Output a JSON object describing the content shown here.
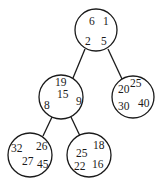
{
  "diagram": {
    "type": "tree",
    "nodes": [
      {
        "id": "root",
        "cx": 96,
        "cy": 30,
        "r": 21,
        "values": [
          {
            "text": "6",
            "x": 89,
            "y": 25
          },
          {
            "text": "1",
            "x": 103,
            "y": 25
          },
          {
            "text": "2",
            "x": 85,
            "y": 45
          },
          {
            "text": "5",
            "x": 101,
            "y": 45
          }
        ]
      },
      {
        "id": "left",
        "cx": 61,
        "cy": 97,
        "r": 22,
        "values": [
          {
            "text": "19",
            "x": 55,
            "y": 86
          },
          {
            "text": "15",
            "x": 57,
            "y": 98
          },
          {
            "text": "8",
            "x": 44,
            "y": 109
          },
          {
            "text": "9",
            "x": 76,
            "y": 105
          }
        ]
      },
      {
        "id": "right",
        "cx": 133,
        "cy": 97,
        "r": 21,
        "values": [
          {
            "text": "20",
            "x": 118,
            "y": 93
          },
          {
            "text": "25",
            "x": 130,
            "y": 87
          },
          {
            "text": "30",
            "x": 118,
            "y": 110
          },
          {
            "text": "40",
            "x": 138,
            "y": 107
          }
        ]
      },
      {
        "id": "left-left",
        "cx": 30,
        "cy": 155,
        "r": 22,
        "values": [
          {
            "text": "32",
            "x": 11,
            "y": 152
          },
          {
            "text": "26",
            "x": 36,
            "y": 150
          },
          {
            "text": "27",
            "x": 22,
            "y": 165
          },
          {
            "text": "45",
            "x": 37,
            "y": 168
          }
        ]
      },
      {
        "id": "left-right",
        "cx": 89,
        "cy": 155,
        "r": 22,
        "values": [
          {
            "text": "25",
            "x": 76,
            "y": 157
          },
          {
            "text": "18",
            "x": 93,
            "y": 149
          },
          {
            "text": "22",
            "x": 74,
            "y": 170
          },
          {
            "text": "16",
            "x": 92,
            "y": 168
          }
        ]
      }
    ],
    "edges": [
      {
        "from": "root",
        "to": "left",
        "x1": 85,
        "y1": 49,
        "x2": 73,
        "y2": 78
      },
      {
        "from": "root",
        "to": "right",
        "x1": 108,
        "y1": 49,
        "x2": 122,
        "y2": 79
      },
      {
        "from": "left",
        "to": "left-left",
        "x1": 52,
        "y1": 117,
        "x2": 43,
        "y2": 136
      },
      {
        "from": "left",
        "to": "left-right",
        "x1": 71,
        "y1": 117,
        "x2": 80,
        "y2": 136
      }
    ]
  }
}
